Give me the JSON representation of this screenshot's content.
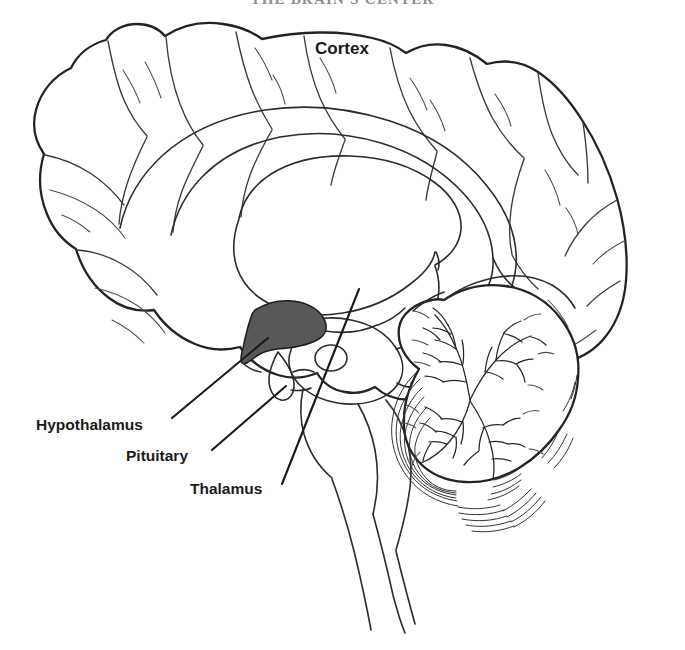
{
  "figure": {
    "title": "THE BRAIN'S CENTER",
    "title_note": "cropped-top heading",
    "background_color": "#ffffff",
    "ink_color": "#232323",
    "shade_color": "#585858",
    "width": 685,
    "height": 650,
    "view": "midsagittal section of human brain, line drawing"
  },
  "labels": {
    "cortex": "Cortex",
    "hypothalamus": "Hypothalamus",
    "pituitary": "Pituitary",
    "thalamus": "Thalamus"
  },
  "structures": [
    {
      "name": "cortex",
      "label": "Cortex",
      "label_position": [
        315,
        40
      ],
      "leader": false,
      "description": "outer folded cerebral surface with gyri and sulci"
    },
    {
      "name": "hypothalamus",
      "label": "Hypothalamus",
      "label_position": [
        36,
        417
      ],
      "leader": true,
      "leader_from": [
        172,
        418
      ],
      "leader_to": [
        268,
        338
      ],
      "shaded": true,
      "shade_color": "#585858",
      "description": "dark shaded wedge below the thalamus"
    },
    {
      "name": "pituitary",
      "label": "Pituitary",
      "label_position": [
        126,
        448
      ],
      "leader": true,
      "leader_from": [
        212,
        450
      ],
      "leader_to": [
        286,
        386
      ],
      "shaded": false,
      "description": "small gland on stalk beneath hypothalamus"
    },
    {
      "name": "thalamus",
      "label": "Thalamus",
      "label_position": [
        190,
        481
      ],
      "leader": true,
      "leader_from": [
        282,
        484
      ],
      "leader_to": [
        359,
        289
      ],
      "shaded": false,
      "description": "oval mass at center of the brain"
    },
    {
      "name": "cerebellum",
      "label": "",
      "leader": false,
      "description": "branching arbor vitae with concentric folia, lower right"
    },
    {
      "name": "corpus-callosum",
      "label": "",
      "leader": false,
      "description": "large arc of white matter above the thalamus"
    },
    {
      "name": "brainstem",
      "label": "",
      "leader": false,
      "description": "descending stalk to lower edge of image"
    }
  ]
}
